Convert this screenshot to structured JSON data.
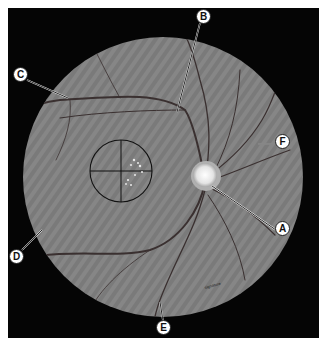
{
  "figure": {
    "background_color": "#050505",
    "fundus_color": "#7d7d7d",
    "disc_color": "#e8e8e8",
    "labels": [
      {
        "id": "A",
        "text": "A",
        "x": 282,
        "y": 228
      },
      {
        "id": "B",
        "text": "B",
        "x": 203,
        "y": 16
      },
      {
        "id": "C",
        "text": "C",
        "x": 20,
        "y": 74
      },
      {
        "id": "D",
        "text": "D",
        "x": 16,
        "y": 256
      },
      {
        "id": "E",
        "text": "E",
        "x": 163,
        "y": 327
      },
      {
        "id": "F",
        "text": "F",
        "x": 282,
        "y": 141
      }
    ],
    "signature": "signature"
  }
}
